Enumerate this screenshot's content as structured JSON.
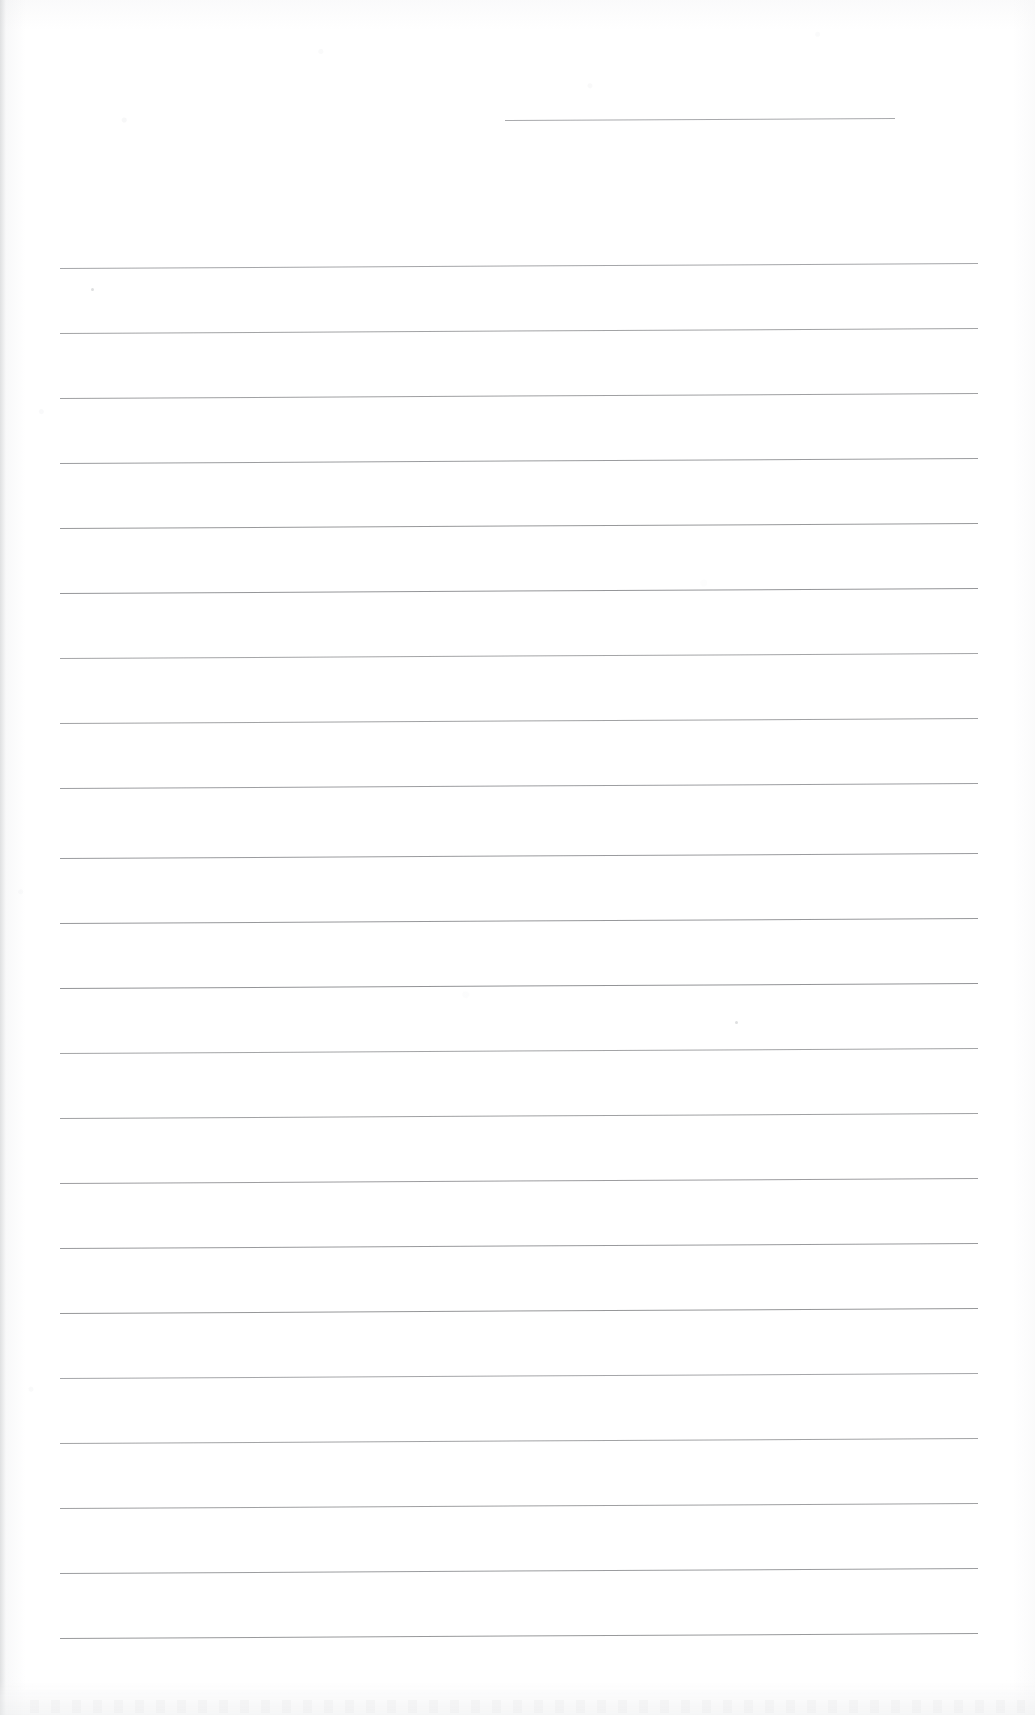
{
  "document": {
    "kind": "scanned-ruled-notebook-page",
    "title": "Blank lined page",
    "page_width": 1035,
    "page_height": 1715,
    "background_color": "#ffffff",
    "rule_color": "#8f9093",
    "text_content": "",
    "handwriting_present": "none",
    "printed_text_present": "none"
  },
  "ruling": {
    "left_margin_x": 60,
    "right_margin_x": 978,
    "line_spacing_px": 65,
    "first_full_line_y": 268,
    "last_full_line_y": 1638,
    "slant_rise_px": 5,
    "line_count": 22,
    "full_lines_y": [
      268,
      333,
      398,
      463,
      528,
      593,
      658,
      723,
      788,
      858,
      923,
      988,
      1053,
      1118,
      1183,
      1248,
      1313,
      1378,
      1443,
      1508,
      1573,
      1638
    ],
    "partial_lines": [
      {
        "x_start": 505,
        "x_end": 895,
        "y": 120,
        "note": "short rule near top right"
      }
    ]
  },
  "artifacts": {
    "specks": [
      {
        "x": 91,
        "y": 288,
        "size": 3
      },
      {
        "x": 735,
        "y": 1021,
        "size": 3
      }
    ],
    "edge_shadow_left_px": 8,
    "bottom_smudge_height_px": 34
  }
}
